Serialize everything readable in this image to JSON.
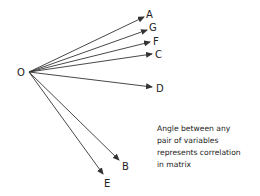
{
  "diagram": {
    "origin": {
      "label": "O",
      "x": 29,
      "y": 72,
      "label_x": 21,
      "label_y": 76
    },
    "vectors": [
      {
        "label": "A",
        "x2": 144,
        "y2": 17,
        "label_x": 146,
        "label_y": 18
      },
      {
        "label": "G",
        "x2": 147,
        "y2": 30,
        "label_x": 149,
        "label_y": 31
      },
      {
        "label": "F",
        "x2": 150,
        "y2": 42,
        "label_x": 153,
        "label_y": 45
      },
      {
        "label": "C",
        "x2": 152,
        "y2": 54,
        "label_x": 155,
        "label_y": 58
      },
      {
        "label": "D",
        "x2": 152,
        "y2": 87,
        "label_x": 156,
        "label_y": 92
      },
      {
        "label": "B",
        "x2": 119,
        "y2": 160,
        "label_x": 122,
        "label_y": 170
      },
      {
        "label": "E",
        "x2": 103,
        "y2": 174,
        "label_x": 104,
        "label_y": 187
      }
    ],
    "line_color": "#333333",
    "note_lines": [
      "Angle between any",
      "pair of variables",
      "represents correlation",
      "in matrix"
    ]
  }
}
